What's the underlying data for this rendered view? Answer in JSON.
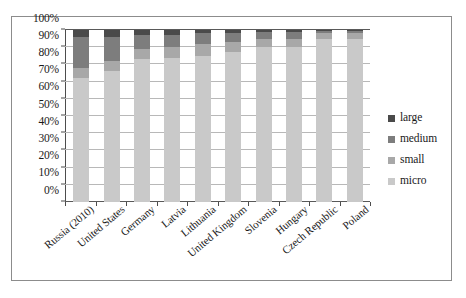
{
  "chart_data": {
    "type": "bar",
    "subtype": "stacked-percent",
    "title": "",
    "xlabel": "",
    "ylabel": "",
    "ylim": [
      0,
      100
    ],
    "ytick_labels": [
      "0%",
      "10%",
      "20%",
      "30%",
      "40%",
      "50%",
      "60%",
      "70%",
      "80%",
      "90%",
      "100%"
    ],
    "ytick_values": [
      0,
      10,
      20,
      30,
      40,
      50,
      60,
      70,
      80,
      90,
      100
    ],
    "grid": true,
    "legend_position": "right",
    "categories": [
      "Russia (2010)",
      "United States",
      "Germany",
      "Latvia",
      "Lithuania",
      "United Kingdom",
      "Slovenia",
      "Hungary",
      "Czech Republic",
      "Poland"
    ],
    "series": [
      {
        "name": "micro",
        "color": "#c9c9c9",
        "values": [
          72,
          76,
          83,
          84,
          85,
          87,
          90,
          90,
          95,
          95
        ]
      },
      {
        "name": "small",
        "color": "#a8a8a8",
        "values": [
          6,
          6,
          6,
          6,
          7,
          6,
          5,
          5,
          3,
          3
        ]
      },
      {
        "name": "medium",
        "color": "#7d7d7d",
        "values": [
          18,
          14,
          8,
          7,
          6,
          5,
          4,
          4,
          1.5,
          1.5
        ]
      },
      {
        "name": "large",
        "color": "#4a4a4a",
        "values": [
          4,
          4,
          3,
          3,
          2,
          2,
          1,
          1,
          0.5,
          0.5
        ]
      }
    ]
  },
  "legend": {
    "entries": [
      {
        "label": "large",
        "color": "#4a4a4a"
      },
      {
        "label": "medium",
        "color": "#7d7d7d"
      },
      {
        "label": "small",
        "color": "#a8a8a8"
      },
      {
        "label": "micro",
        "color": "#c9c9c9"
      }
    ]
  }
}
